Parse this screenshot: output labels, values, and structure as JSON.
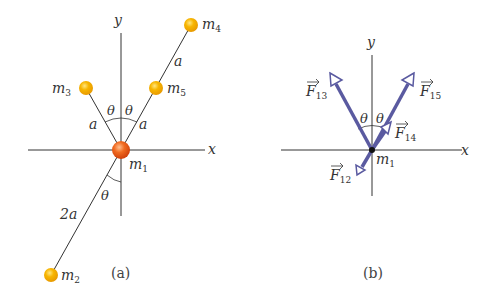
{
  "panel_a": {
    "caption": "(a)",
    "axis_x": "x",
    "axis_y": "y",
    "masses": [
      {
        "id": "m1",
        "label": "m",
        "sub": "1"
      },
      {
        "id": "m2",
        "label": "m",
        "sub": "2"
      },
      {
        "id": "m3",
        "label": "m",
        "sub": "3"
      },
      {
        "id": "m4",
        "label": "m",
        "sub": "4"
      },
      {
        "id": "m5",
        "label": "m",
        "sub": "5"
      }
    ],
    "distances": {
      "m1_m3": "a",
      "m1_m5": "a",
      "m5_m4": "a",
      "m1_m2": "2a"
    },
    "angles": {
      "left": "θ",
      "right": "θ",
      "lower": "θ"
    }
  },
  "panel_b": {
    "caption": "(b)",
    "axis_x": "x",
    "axis_y": "y",
    "origin_label": {
      "label": "m",
      "sub": "1"
    },
    "forces": [
      {
        "id": "F13",
        "label": "F",
        "sub": "13"
      },
      {
        "id": "F15",
        "label": "F",
        "sub": "15"
      },
      {
        "id": "F14",
        "label": "F",
        "sub": "14"
      },
      {
        "id": "F12",
        "label": "F",
        "sub": "12"
      }
    ],
    "angles": {
      "left": "θ",
      "right": "θ"
    }
  },
  "colors": {
    "axis": "#333333",
    "rod": "#333333",
    "mass_small": "#f5b400",
    "mass_center": "#e8501a",
    "force_arrow": "#5a5aa0",
    "text": "#333333"
  }
}
